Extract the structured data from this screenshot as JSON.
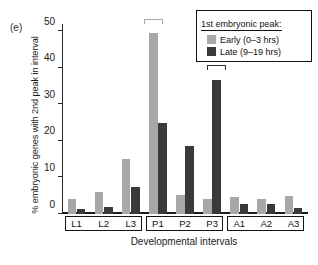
{
  "panel": {
    "label": "(e)"
  },
  "legend": {
    "title": "1st embryonic peak:",
    "entries": [
      {
        "label": "Early (0–3 hrs)",
        "color": "#a8a8a8",
        "key": "early"
      },
      {
        "label": "Late (9–19 hrs)",
        "color": "#3a3a3a",
        "key": "late"
      }
    ]
  },
  "chart_data": {
    "type": "bar",
    "title": "",
    "xlabel": "Developmental intervals",
    "ylabel": "% embryonic genes with 2nd peak in interval",
    "categories": [
      "L1",
      "L2",
      "L3",
      "P1",
      "P2",
      "P3",
      "A1",
      "A2",
      "A3"
    ],
    "category_groups": [
      {
        "name": "L",
        "categories": [
          "L1",
          "L2",
          "L3"
        ]
      },
      {
        "name": "P",
        "categories": [
          "P1",
          "P2",
          "P3"
        ]
      },
      {
        "name": "A",
        "categories": [
          "A1",
          "A2",
          "A3"
        ]
      }
    ],
    "series": [
      {
        "name": "Early (0–3 hrs)",
        "color": "#a8a8a8",
        "values": [
          4.1,
          6.1,
          15.1,
          49.5,
          5.3,
          4.2,
          4.7,
          4.0,
          5.0
        ]
      },
      {
        "name": "Late (9–19 hrs)",
        "color": "#3a3a3a",
        "values": [
          1.5,
          1.8,
          7.5,
          25.0,
          18.7,
          36.6,
          2.8,
          2.8,
          1.6
        ]
      }
    ],
    "ylim": [
      0,
      52
    ],
    "yticks": [
      0,
      10,
      20,
      30,
      40,
      50
    ],
    "ytick_labels": [
      "0",
      "10",
      "20",
      "30",
      "40",
      "50"
    ],
    "grid": false,
    "legend_position": "top-right",
    "annotations": [
      {
        "type": "significance-bracket",
        "category": "P1",
        "series": "Early (0–3 hrs)",
        "color": "#a8a8a8",
        "top_value": 52.0
      },
      {
        "type": "significance-bracket",
        "category": "P3",
        "series": "Late (9–19 hrs)",
        "color": "#2e2e2e",
        "top_value": 39.5
      }
    ]
  }
}
